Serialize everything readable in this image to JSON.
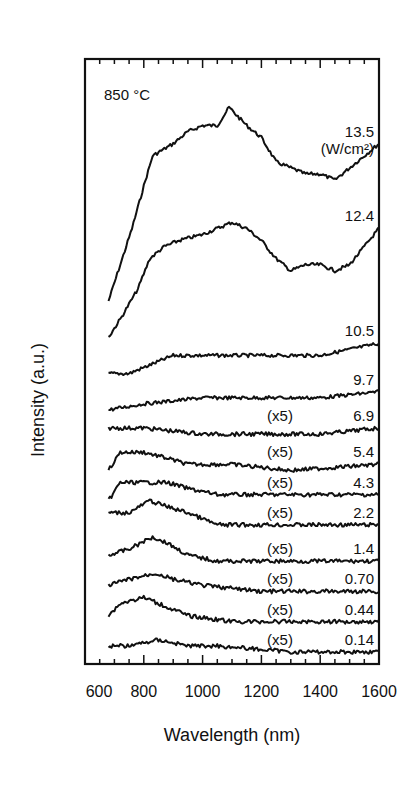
{
  "chart_data": {
    "type": "line",
    "title": "",
    "annotation": "850 °C",
    "xlabel": "Wavelength (nm)",
    "ylabel": "Intensity (a.u.)",
    "xlim": [
      600,
      1600
    ],
    "xticks": [
      600,
      800,
      1000,
      1200,
      1400,
      1600
    ],
    "ylim": [
      0,
      100
    ],
    "grid": false,
    "legend": "inline labels at right end of each trace",
    "unit_label": "(W/cm²)",
    "note": "Traces vertically offset; values are relative intensity (a.u.) on a 0–100 display scale. Traces marked (x5) are magnified 5x.",
    "series": [
      {
        "name": "13.5",
        "multiplier": "",
        "points": [
          [
            680,
            60
          ],
          [
            720,
            66
          ],
          [
            760,
            72
          ],
          [
            800,
            79
          ],
          [
            830,
            84
          ],
          [
            900,
            86
          ],
          [
            950,
            88
          ],
          [
            1000,
            89
          ],
          [
            1050,
            89
          ],
          [
            1090,
            92
          ],
          [
            1150,
            89
          ],
          [
            1200,
            87
          ],
          [
            1250,
            83
          ],
          [
            1300,
            82
          ],
          [
            1350,
            81
          ],
          [
            1400,
            81
          ],
          [
            1450,
            80
          ],
          [
            1500,
            82
          ],
          [
            1550,
            84
          ],
          [
            1600,
            86
          ]
        ]
      },
      {
        "name": "12.4",
        "multiplier": "",
        "points": [
          [
            680,
            54
          ],
          [
            720,
            57
          ],
          [
            780,
            62
          ],
          [
            820,
            67
          ],
          [
            870,
            69
          ],
          [
            920,
            70
          ],
          [
            1000,
            71
          ],
          [
            1050,
            72
          ],
          [
            1100,
            73
          ],
          [
            1150,
            72
          ],
          [
            1200,
            70
          ],
          [
            1250,
            67
          ],
          [
            1300,
            65
          ],
          [
            1350,
            66
          ],
          [
            1400,
            66
          ],
          [
            1450,
            65
          ],
          [
            1500,
            66
          ],
          [
            1550,
            69
          ],
          [
            1600,
            72
          ]
        ]
      },
      {
        "name": "10.5",
        "multiplier": "",
        "points": [
          [
            680,
            48
          ],
          [
            750,
            48
          ],
          [
            800,
            49
          ],
          [
            850,
            50
          ],
          [
            900,
            51
          ],
          [
            1000,
            51
          ],
          [
            1100,
            51
          ],
          [
            1200,
            51
          ],
          [
            1300,
            51
          ],
          [
            1400,
            51
          ],
          [
            1500,
            52
          ],
          [
            1600,
            53
          ]
        ]
      },
      {
        "name": "9.7",
        "multiplier": "",
        "points": [
          [
            680,
            42
          ],
          [
            800,
            43
          ],
          [
            1000,
            44
          ],
          [
            1200,
            44
          ],
          [
            1400,
            44
          ],
          [
            1600,
            45
          ]
        ]
      },
      {
        "name": "6.9",
        "multiplier": "(x5)",
        "points": [
          [
            680,
            39
          ],
          [
            800,
            39
          ],
          [
            1000,
            38
          ],
          [
            1200,
            38
          ],
          [
            1400,
            38
          ],
          [
            1600,
            39
          ]
        ]
      },
      {
        "name": "5.4",
        "multiplier": "(x5)",
        "points": [
          [
            680,
            32
          ],
          [
            720,
            35
          ],
          [
            800,
            35
          ],
          [
            880,
            34
          ],
          [
            950,
            33
          ],
          [
            1100,
            33
          ],
          [
            1300,
            32
          ],
          [
            1600,
            33
          ]
        ]
      },
      {
        "name": "4.3",
        "multiplier": "(x5)",
        "points": [
          [
            680,
            27
          ],
          [
            720,
            30
          ],
          [
            800,
            30
          ],
          [
            880,
            30
          ],
          [
            950,
            29
          ],
          [
            1050,
            28
          ],
          [
            1300,
            28
          ],
          [
            1600,
            28
          ]
        ]
      },
      {
        "name": "2.2",
        "multiplier": "(x5)",
        "points": [
          [
            680,
            25
          ],
          [
            750,
            25
          ],
          [
            820,
            27
          ],
          [
            880,
            26
          ],
          [
            950,
            25
          ],
          [
            1050,
            23
          ],
          [
            1300,
            23
          ],
          [
            1600,
            23
          ]
        ]
      },
      {
        "name": "1.4",
        "multiplier": "(x5)",
        "points": [
          [
            680,
            18
          ],
          [
            750,
            19
          ],
          [
            830,
            21
          ],
          [
            880,
            20
          ],
          [
            950,
            18
          ],
          [
            1050,
            17
          ],
          [
            1300,
            17
          ],
          [
            1600,
            17
          ]
        ]
      },
      {
        "name": "0.70",
        "multiplier": "(x5)",
        "points": [
          [
            680,
            13
          ],
          [
            750,
            14
          ],
          [
            840,
            15
          ],
          [
            900,
            14
          ],
          [
            1000,
            13
          ],
          [
            1200,
            12
          ],
          [
            1600,
            12
          ]
        ]
      },
      {
        "name": "0.44",
        "multiplier": "(x5)",
        "points": [
          [
            680,
            8
          ],
          [
            720,
            10
          ],
          [
            800,
            11
          ],
          [
            850,
            10
          ],
          [
            950,
            8
          ],
          [
            1100,
            7
          ],
          [
            1600,
            7
          ]
        ]
      },
      {
        "name": "0.14",
        "multiplier": "(x5)",
        "points": [
          [
            680,
            3
          ],
          [
            750,
            3
          ],
          [
            850,
            4
          ],
          [
            950,
            3
          ],
          [
            1050,
            3
          ],
          [
            1300,
            2
          ],
          [
            1600,
            2
          ]
        ]
      }
    ]
  }
}
